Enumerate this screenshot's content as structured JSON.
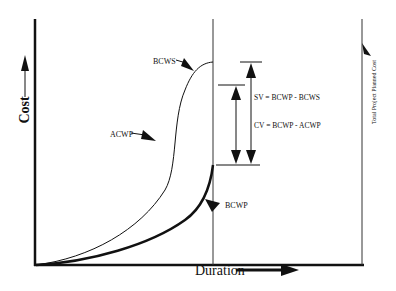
{
  "diagram": {
    "type": "earned-value-s-curve",
    "axes": {
      "y_label": "Cost",
      "x_label": "Duration"
    },
    "curve_labels": {
      "bcws": "BCWS",
      "acwp": "ACWP",
      "bcwp": "BCWP"
    },
    "formulas": {
      "sv": "SV = BCWP - BCWS",
      "cv": "CV = BCWP - ACWP"
    },
    "right_line_label": "Total Project Planned Cost",
    "colors": {
      "line": "#111111",
      "background": "#ffffff"
    }
  }
}
